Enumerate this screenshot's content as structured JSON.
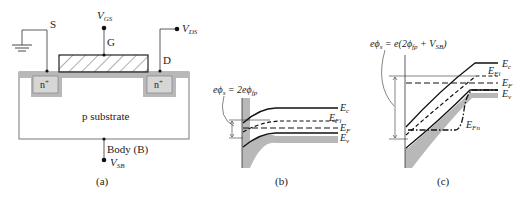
{
  "panel_a": {
    "caption": "(a)",
    "source_label": "S",
    "gate_label": "G",
    "drain_label": "D",
    "gate_voltage": "V",
    "gate_voltage_sub": "GS",
    "drain_voltage": "V",
    "drain_voltage_sub": "DS",
    "source_region": "n",
    "drain_region": "n",
    "doping_sup": "+",
    "substrate_label": "p substrate",
    "body_label": "Body (B)",
    "body_voltage": "V",
    "body_voltage_sub": "SB"
  },
  "panel_b": {
    "caption": "(b)",
    "equation": "eϕs = 2eϕfp",
    "eq_lhs": "eϕ",
    "eq_lhs_sub": "s",
    "eq_mid": " = 2eϕ",
    "eq_rhs_sub": "fp",
    "levels": {
      "ec": "E",
      "ec_sub": "c",
      "efi": "E",
      "efi_sub": "Fi",
      "ef": "E",
      "ef_sub": "F",
      "ev": "E",
      "ev_sub": "v"
    }
  },
  "panel_c": {
    "caption": "(c)",
    "equation": "eϕs = e(2ϕfp + VSB)",
    "eq_lhs": "eϕ",
    "eq_lhs_sub": "s",
    "eq_mid": " = e(2ϕ",
    "eq_mid_sub": "fp",
    "eq_plus": " + V",
    "eq_vsb_sub": "SB",
    "eq_close": ")",
    "levels": {
      "ec": "E",
      "ec_sub": "c",
      "efi": "E",
      "efi_sub": "Fi",
      "ef": "E",
      "ef_sub": "F",
      "ev": "E",
      "ev_sub": "v",
      "efn": "E",
      "efn_sub": "Fn"
    }
  }
}
